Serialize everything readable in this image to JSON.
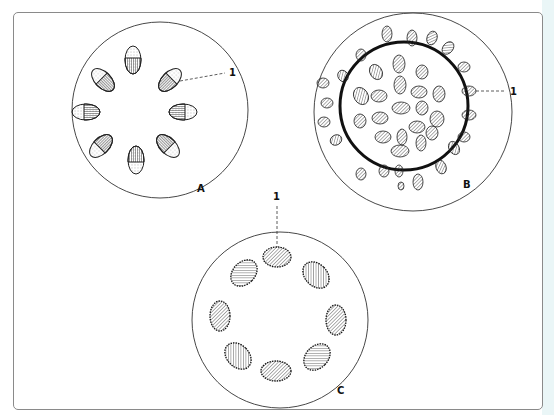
{
  "figure": {
    "panels": [
      {
        "id": "A",
        "label": "A",
        "callout": "1",
        "description": "Circle with 8 oval grains arranged in a ring, half-hatched"
      },
      {
        "id": "B",
        "label": "B",
        "callout": "1",
        "description": "Circle with thick inner ring and many scattered small grains"
      },
      {
        "id": "C",
        "label": "C",
        "callout": "1",
        "description": "Circle with 7 spiny oval grains arranged in a ring"
      }
    ]
  },
  "colors": {
    "line": "#222222",
    "frame": "#8a8a8a",
    "edge": "#eaf6f7"
  }
}
